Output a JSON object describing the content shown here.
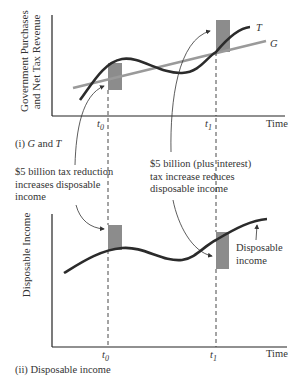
{
  "panel_top": {
    "caption_prefix": "(i)",
    "caption_g": "G",
    "caption_and": "and",
    "caption_t": "T",
    "y_axis_title_line1": "Government Purchases",
    "y_axis_title_line2": "and Net Tax Revenue",
    "x_axis_label": "Time",
    "t0_label": "t",
    "t0_sub": "0",
    "t1_label": "t",
    "t1_sub": "1",
    "curve_t_label": "T",
    "line_g_label": "G"
  },
  "panel_bottom": {
    "caption": "(ii) Disposable income",
    "y_axis_title": "Disposable Income",
    "x_axis_label": "Time",
    "t0_label": "t",
    "t0_sub": "0",
    "t1_label": "t",
    "t1_sub": "1",
    "curve_label_line1": "Disposable",
    "curve_label_line2": "income"
  },
  "annotations": {
    "left_line1": "$5 billion tax reduction",
    "left_line2": "increases disposable",
    "left_line3": "income",
    "right_line1": "$5 billion (plus interest)",
    "right_line2": "tax increase reduces",
    "right_line3": "disposable income"
  },
  "colors": {
    "curve": "#2b2b2b",
    "g_line": "#9a9a9a",
    "shade": "#8c8c8c",
    "axis": "#222222"
  }
}
